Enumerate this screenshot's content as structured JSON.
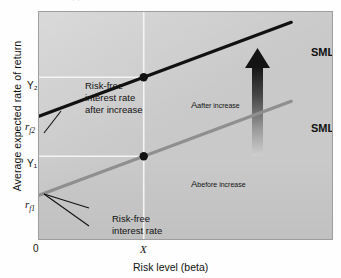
{
  "chart_data": {
    "type": "line",
    "title": "",
    "xlabel": "Risk level (beta)",
    "ylabel": "Average expected rate of return",
    "xlim": [
      0,
      1
    ],
    "ylim": [
      0,
      1
    ],
    "grid": true,
    "legend_position": "inline-right",
    "xticks": [
      "0",
      "X"
    ],
    "yticks": [
      "Y₂",
      "rf₂",
      "Y₁",
      "rf₁"
    ],
    "series": [
      {
        "name": "SML₂",
        "label": "SML",
        "label_sub": "2",
        "color": "#111111",
        "linewidth": 3.2,
        "description": "Security market line after risk-free interest rate increase",
        "points": [
          {
            "x": 0.0,
            "y": 0.545,
            "tick": "rf₂"
          },
          {
            "x": 0.355,
            "y": 0.715,
            "tick": "Y₂",
            "marker": true,
            "label": "A",
            "label_sub": "after increase"
          },
          {
            "x": 0.855,
            "y": 0.955
          }
        ]
      },
      {
        "name": "SML₁",
        "label": "SML",
        "label_sub": "1",
        "color": "#8f8f8f",
        "linewidth": 3.2,
        "description": "Security market line before risk-free interest rate increase",
        "points": [
          {
            "x": 0.0,
            "y": 0.2,
            "tick": "rf₁"
          },
          {
            "x": 0.355,
            "y": 0.37,
            "tick": "Y₁",
            "marker": true,
            "label": "A",
            "label_sub": "before increase"
          },
          {
            "x": 0.855,
            "y": 0.61
          }
        ]
      }
    ],
    "annotations": [
      {
        "name": "rf2-callout",
        "lines": [
          "Risk-free",
          "interest rate",
          "after increase"
        ],
        "points_to": "rf₂"
      },
      {
        "name": "rf1-callout",
        "lines": [
          "Risk-free",
          "interest rate",
          "before increase"
        ],
        "points_to": "rf₁"
      },
      {
        "name": "shift-arrow",
        "kind": "up-arrow",
        "description": "Upward arrow showing the shift from SML1 to SML2"
      }
    ],
    "colors": {
      "plot_background": "#c9c9c9",
      "plot_border": "#9e9e9e",
      "sml2": "#111111",
      "sml1": "#8f8f8f",
      "gridline": "#f2f2f2",
      "text": "#111111",
      "arrow_top": "#1b1b1b",
      "arrow_bottom": "#bdbdbd"
    }
  },
  "figure": {
    "top_artifact": "·  ·"
  }
}
